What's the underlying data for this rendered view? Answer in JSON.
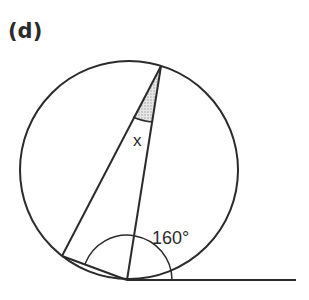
{
  "figure": {
    "part_label": "(d)",
    "unknown_angle_label": "x",
    "given_angle_label": "160°",
    "colors": {
      "stroke": "#2b2b2b",
      "shade": "#cfcfcf",
      "background": "#ffffff"
    }
  }
}
